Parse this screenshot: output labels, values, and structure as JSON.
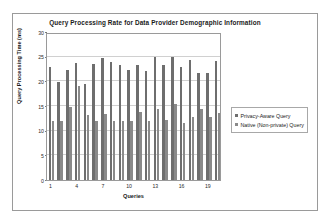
{
  "chart_data": {
    "type": "bar",
    "title": "Query Processing Rate for Data Provider Demographic Information",
    "xlabel": "Queries",
    "ylabel": "Query Processing Time (ms)",
    "ylim": [
      0,
      30
    ],
    "ytick_values": [
      0,
      5,
      10,
      15,
      20,
      25,
      30
    ],
    "ytick_labels": [
      "0",
      "5",
      "10",
      "15",
      "20",
      "25",
      "30"
    ],
    "xtick_labels": [
      "1",
      "4",
      "7",
      "10",
      "13",
      "16",
      "19"
    ],
    "xtick_positions": [
      1,
      4,
      7,
      10,
      13,
      16,
      19
    ],
    "categories": [
      1,
      2,
      3,
      4,
      5,
      6,
      7,
      8,
      9,
      10,
      11,
      12,
      13,
      14,
      15,
      16,
      17,
      18,
      19,
      20
    ],
    "grid": true,
    "grid_axis": "y",
    "legend_position": "right",
    "series": [
      {
        "name": "Privacy-Aware Query",
        "color": "#6e6e6e",
        "values": [
          22.9,
          19.8,
          22.3,
          23.8,
          19.4,
          23.5,
          24.8,
          23.9,
          23.3,
          22.2,
          23.3,
          22.1,
          24.9,
          23.3,
          25.0,
          23.0,
          24.3,
          21.6,
          21.6,
          24.1
        ]
      },
      {
        "name": "Native (Non-private) Query",
        "color": "#8a8a8a",
        "values": [
          11.9,
          11.9,
          14.9,
          19.0,
          13.1,
          12.0,
          13.3,
          12.0,
          11.9,
          11.9,
          13.7,
          11.9,
          14.3,
          12.1,
          15.5,
          11.5,
          12.8,
          14.4,
          12.7,
          13.5
        ]
      }
    ]
  },
  "legend": {
    "items": [
      {
        "label": "Privacy-Aware Query"
      },
      {
        "label": "Native (Non-private) Query"
      }
    ]
  }
}
